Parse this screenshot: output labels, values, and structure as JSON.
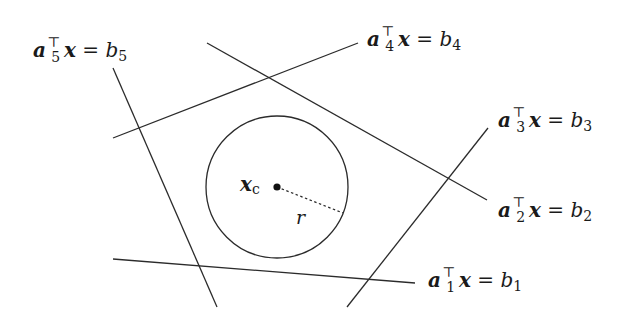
{
  "diagram": {
    "colors": {
      "stroke": "#2b2b2b",
      "background": "#ffffff"
    },
    "lines": [
      {
        "id": "1",
        "x1": 113,
        "y1": 259,
        "x2": 415,
        "y2": 283,
        "label": {
          "vec": "a",
          "sub": "1",
          "sup": "⊤",
          "var": "x",
          "rhs": "b",
          "rhs_sub": "1",
          "x": 428,
          "y": 287
        }
      },
      {
        "id": "2",
        "x1": 207,
        "y1": 43,
        "x2": 487,
        "y2": 200,
        "label": {
          "vec": "a",
          "sub": "2",
          "sup": "⊤",
          "var": "x",
          "rhs": "b",
          "rhs_sub": "2",
          "x": 498,
          "y": 217
        }
      },
      {
        "id": "3",
        "x1": 347,
        "y1": 307,
        "x2": 488,
        "y2": 128,
        "label": {
          "vec": "a",
          "sub": "3",
          "sup": "⊤",
          "var": "x",
          "rhs": "b",
          "rhs_sub": "3",
          "x": 498,
          "y": 127
        }
      },
      {
        "id": "4",
        "x1": 113,
        "y1": 138,
        "x2": 358,
        "y2": 43,
        "label": {
          "vec": "a",
          "sub": "4",
          "sup": "⊤",
          "var": "x",
          "rhs": "b",
          "rhs_sub": "4",
          "x": 367,
          "y": 46
        }
      },
      {
        "id": "5",
        "x1": 113,
        "y1": 68,
        "x2": 217,
        "y2": 307,
        "label": {
          "vec": "a",
          "sub": "5",
          "sup": "⊤",
          "var": "x",
          "rhs": "b",
          "rhs_sub": "5",
          "x": 33,
          "y": 57
        }
      }
    ],
    "circle": {
      "cx": 277,
      "cy": 187,
      "r": 71
    },
    "center": {
      "label": "x",
      "label_sub": "c",
      "x": 240,
      "y": 191
    },
    "radius": {
      "label": "r",
      "x2": 343,
      "y2": 213,
      "label_x": 296,
      "label_y": 224
    },
    "equals": "="
  }
}
